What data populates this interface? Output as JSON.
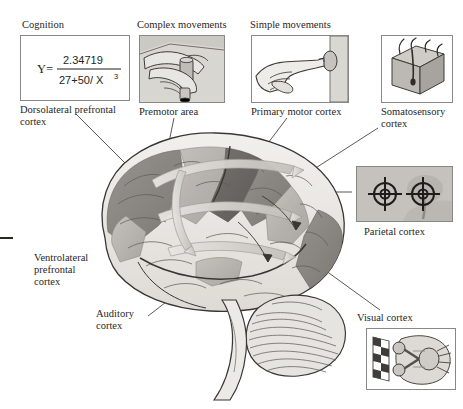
{
  "figure": {
    "background": "#ffffff",
    "ink": "#2a2523"
  },
  "equation": {
    "lhs": "Y=",
    "numerator": "2.34719",
    "denominator_left": "27+50/ X",
    "denominator_exp": "3"
  },
  "panels": [
    {
      "id": "cognition",
      "heading": "Cognition",
      "caption_line1": "Dorsolateral prefrontal",
      "caption_line2": "cortex",
      "content": "equation-box"
    },
    {
      "id": "complex-movements",
      "heading": "Complex movements",
      "caption_line1": "Premotor area",
      "caption_line2": "",
      "content": "hands-grasping-object"
    },
    {
      "id": "simple-movements",
      "heading": "Simple movements",
      "caption_line1": "Primary motor cortex",
      "caption_line2": "",
      "content": "finger-pressing-button"
    },
    {
      "id": "somatosensory",
      "heading": "",
      "caption_line1": "Somatosensory",
      "caption_line2": "cortex",
      "content": "skin-block-with-hairs"
    },
    {
      "id": "parietal",
      "heading": "",
      "caption_line1": "Parietal cortex",
      "caption_line2": "",
      "content": "two-crosshair-targets"
    },
    {
      "id": "visual",
      "heading": "Visual cortex",
      "caption_line1": "",
      "caption_line2": "",
      "content": "checkerboard-and-optic-chiasm"
    }
  ],
  "brain_labels": [
    {
      "id": "ventrolateral",
      "line1": "Ventrolateral",
      "line2": "prefrontal",
      "line3": "cortex"
    },
    {
      "id": "auditory",
      "line1": "Auditory",
      "line2": "cortex",
      "line3": ""
    }
  ],
  "colors": {
    "panel_border": "#8a8885",
    "panel_fill": "#c9c7c2",
    "brain_light": "#e9e7e3",
    "brain_mid": "#b9b6b1",
    "brain_dark": "#8f8c87",
    "brain_darker": "#6f6c68",
    "outline": "#3a3633",
    "leader": "#4a4643"
  }
}
